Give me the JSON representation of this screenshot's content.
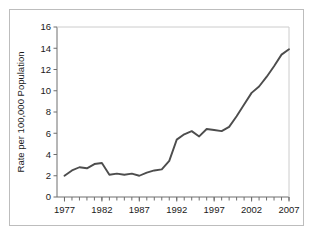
{
  "chart_data": {
    "type": "line",
    "title": "",
    "xlabel": "",
    "ylabel": "Rate per 100,000 Population",
    "xlim": [
      1976,
      2007
    ],
    "ylim": [
      0,
      16
    ],
    "grid": false,
    "legend": null,
    "line_color": "#4d4d4d",
    "axis_color": "#6e6e6e",
    "frame_color": "#bdbdbd",
    "background_color": "#ffffff",
    "x_tick_labels": [
      "1977",
      "1982",
      "1987",
      "1992",
      "1997",
      "2002",
      "2007"
    ],
    "x_tick_values": [
      1977,
      1982,
      1987,
      1992,
      1997,
      2002,
      2007
    ],
    "x_minor_tick_interval": 1,
    "y_tick_labels": [
      "0",
      "2",
      "4",
      "6",
      "8",
      "10",
      "12",
      "14",
      "16"
    ],
    "y_tick_values": [
      0,
      2,
      4,
      6,
      8,
      10,
      12,
      14,
      16
    ],
    "x": [
      1977,
      1978,
      1979,
      1980,
      1981,
      1982,
      1983,
      1984,
      1985,
      1986,
      1987,
      1988,
      1989,
      1990,
      1991,
      1992,
      1993,
      1994,
      1995,
      1996,
      1997,
      1998,
      1999,
      2000,
      2001,
      2002,
      2003,
      2004,
      2005,
      2006,
      2007
    ],
    "values": [
      2.0,
      2.5,
      2.8,
      2.7,
      3.1,
      3.2,
      2.1,
      2.2,
      2.1,
      2.2,
      2.0,
      2.3,
      2.5,
      2.6,
      3.4,
      5.4,
      5.9,
      6.2,
      5.7,
      6.4,
      6.3,
      6.2,
      6.6,
      7.6,
      8.7,
      9.8,
      10.4,
      11.3,
      12.3,
      13.4,
      13.9
    ],
    "series": [
      {
        "name": "Rate per 100,000 Population",
        "values": [
          2.0,
          2.5,
          2.8,
          2.7,
          3.1,
          3.2,
          2.1,
          2.2,
          2.1,
          2.2,
          2.0,
          2.3,
          2.5,
          2.6,
          3.4,
          5.4,
          5.9,
          6.2,
          5.7,
          6.4,
          6.3,
          6.2,
          6.6,
          7.6,
          8.7,
          9.8,
          10.4,
          11.3,
          12.3,
          13.4,
          13.9
        ]
      }
    ]
  }
}
